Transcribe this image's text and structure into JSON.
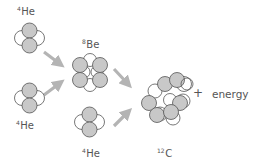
{
  "nuclei": {
    "he_top": {
      "mass": "4",
      "symbol": "He"
    },
    "he_mid": {
      "mass": "4",
      "symbol": "He"
    },
    "be": {
      "mass": "8",
      "symbol": "Be"
    },
    "he_bottom": {
      "mass": "4",
      "symbol": "He"
    },
    "carbon": {
      "mass": "12",
      "symbol": "C"
    }
  },
  "plus": "+",
  "energy": "energy",
  "colors": {
    "proton_fill": "#c8c8c8",
    "neutron_fill": "#ffffff",
    "outline": "#555555",
    "arrow": "#b4b4b4"
  }
}
